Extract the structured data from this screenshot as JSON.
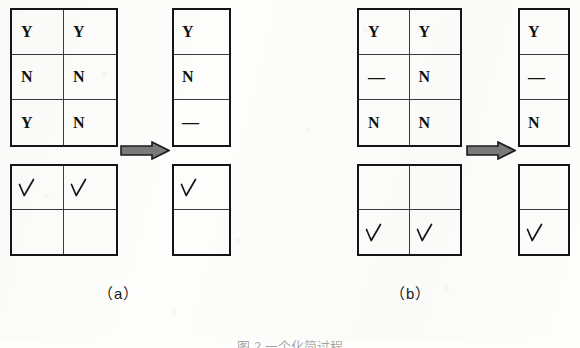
{
  "figure": {
    "caption": "图 2  一个化简过程",
    "subfigures": [
      {
        "id": "a",
        "label": "（a）",
        "source_matrix": {
          "rows": 3,
          "cols": 2,
          "values": [
            [
              "Y",
              "Y"
            ],
            [
              "N",
              "N"
            ],
            [
              "Y",
              "N"
            ]
          ]
        },
        "result_matrix": {
          "rows": 3,
          "cols": 1,
          "values": [
            [
              "Y"
            ],
            [
              "N"
            ],
            [
              "—"
            ]
          ]
        },
        "source_marks": {
          "rows": 2,
          "cols": 2,
          "values": [
            [
              "√",
              "√"
            ],
            [
              "",
              ""
            ]
          ]
        },
        "result_marks": {
          "rows": 2,
          "cols": 1,
          "values": [
            [
              "√"
            ],
            [
              ""
            ]
          ]
        },
        "arrow": "right-arrow-icon"
      },
      {
        "id": "b",
        "label": "（b）",
        "source_matrix": {
          "rows": 3,
          "cols": 2,
          "values": [
            [
              "Y",
              "Y"
            ],
            [
              "—",
              "N"
            ],
            [
              "N",
              "N"
            ]
          ]
        },
        "result_matrix": {
          "rows": 3,
          "cols": 1,
          "values": [
            [
              "Y"
            ],
            [
              "—"
            ],
            [
              "N"
            ]
          ]
        },
        "source_marks": {
          "rows": 2,
          "cols": 2,
          "values": [
            [
              "",
              ""
            ],
            [
              "√",
              "√"
            ]
          ]
        },
        "result_marks": {
          "rows": 2,
          "cols": 1,
          "values": [
            [
              ""
            ],
            [
              "√"
            ]
          ]
        },
        "arrow": "right-arrow-icon"
      }
    ],
    "colors": {
      "ink": "#151515",
      "inner_rule": "#3a3a3a",
      "arrow_fill": "#7a7a7a",
      "arrow_stroke": "#1b1b1b",
      "page": "#fdfdfb"
    }
  }
}
